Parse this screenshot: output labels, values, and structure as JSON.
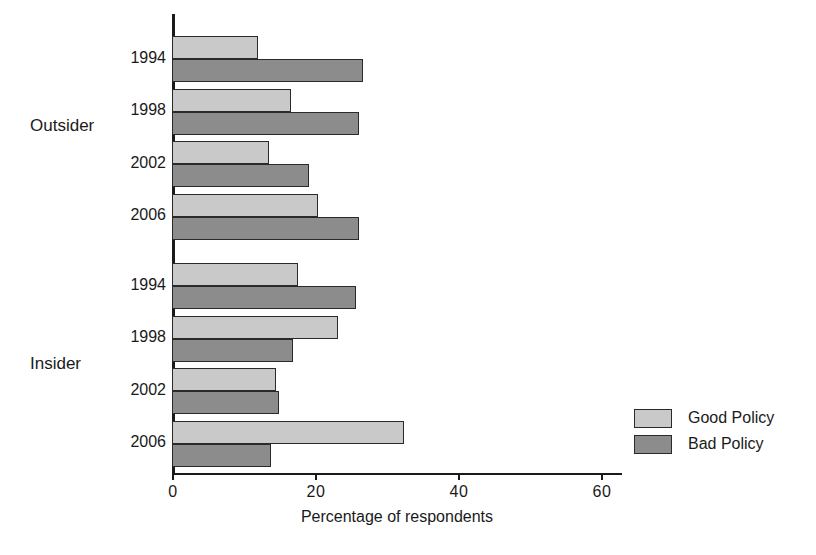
{
  "chart_data": {
    "type": "bar",
    "orientation": "horizontal",
    "title": "",
    "xlabel": "Percentage of respondents",
    "ylabel": "",
    "xlim": [
      0,
      65
    ],
    "xticks": [
      0,
      20,
      40,
      60
    ],
    "xtick_labels": [
      "0",
      "20",
      "40",
      "60"
    ],
    "grid": false,
    "legend_position": "right",
    "groups": [
      {
        "name": "Outsider",
        "categories": [
          "1994",
          "1998",
          "2002",
          "2006"
        ]
      },
      {
        "name": "Insider",
        "categories": [
          "1994",
          "1998",
          "2002",
          "2006"
        ]
      }
    ],
    "categories": [
      "Outsider 1994",
      "Outsider 1998",
      "Outsider 2002",
      "Outsider 2006",
      "Insider 1994",
      "Insider 1998",
      "Insider 2002",
      "Insider 2006"
    ],
    "series": [
      {
        "name": "Good Policy",
        "color": "#c9c9c9",
        "values": [
          12.0,
          16.5,
          13.5,
          20.3,
          17.5,
          23.0,
          14.5,
          32.2
        ]
      },
      {
        "name": "Bad Policy",
        "color": "#8c8c8c",
        "values": [
          26.5,
          26.0,
          19.0,
          26.0,
          25.6,
          16.8,
          14.8,
          13.8
        ]
      }
    ]
  },
  "axis": {
    "x_title": "Percentage of respondents",
    "tick_labels": [
      "0",
      "20",
      "40",
      "60"
    ]
  },
  "legend": {
    "items": [
      {
        "label": "Good Policy",
        "color": "#c9c9c9"
      },
      {
        "label": "Bad Policy",
        "color": "#8c8c8c"
      }
    ]
  },
  "group_labels": [
    "Outsider",
    "Insider"
  ],
  "category_labels": [
    "1994",
    "1998",
    "2002",
    "2006",
    "1994",
    "1998",
    "2002",
    "2006"
  ],
  "colors": {
    "good_policy": "#c9c9c9",
    "bad_policy": "#8c8c8c",
    "axis": "#1a1a1a",
    "background": "#ffffff"
  }
}
